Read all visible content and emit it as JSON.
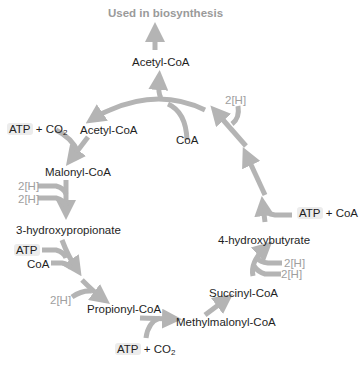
{
  "title": "Used in biosynthesis",
  "arrow_color": "#b4b4b4",
  "arrow_stroke": "#9a9a9a",
  "metabolites": {
    "acetyl_coa_top": "Acetyl-CoA",
    "acetyl_coa_left": "Acetyl-CoA",
    "coa_top": "CoA",
    "malonyl_coa": "Malonyl-CoA",
    "hydroxypropionate": "3-hydroxypropionate",
    "propionyl_coa": "Propionyl-CoA",
    "methylmalonyl_coa": "Methylmalonyl-CoA",
    "succinyl_coa": "Succinyl-CoA",
    "hydroxybutyrate": "4-hydroxybutyrate"
  },
  "cofactors": {
    "atp_co2_left": {
      "atp": "ATP",
      "plus": "+ CO",
      "sub": "2"
    },
    "two_h_malonyl_1": "2[H]",
    "two_h_malonyl_2": "2[H]",
    "atp_hp": "ATP",
    "coa_hp": "CoA",
    "two_h_propionyl": "2[H]",
    "atp_co2_bottom": {
      "atp": "ATP",
      "plus": "+ CO",
      "sub": "2"
    },
    "two_h_succinyl_1": "2[H]",
    "two_h_succinyl_2": "2[H]",
    "atp_coa_right": {
      "atp": "ATP",
      "plus": "+ CoA"
    },
    "two_h_top_right": "2[H]"
  }
}
